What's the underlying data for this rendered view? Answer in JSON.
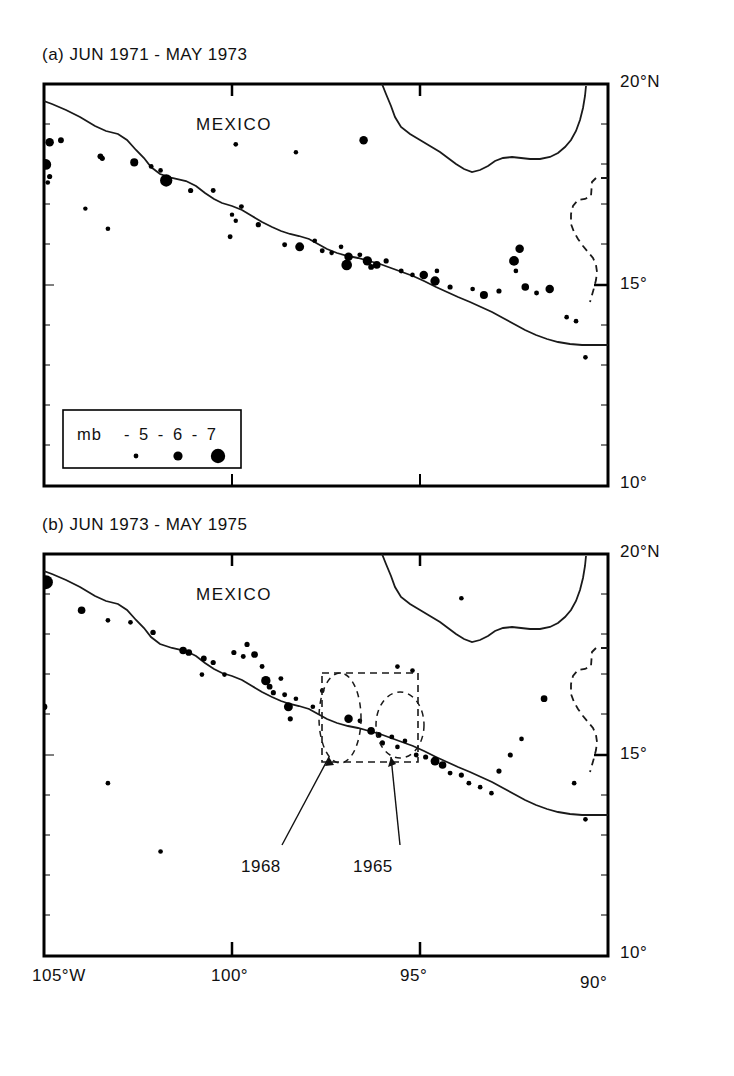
{
  "figure": {
    "panels": [
      {
        "id": "a",
        "title": "(a) JUN 1971 - MAY 1973",
        "region_label": "MEXICO"
      },
      {
        "id": "b",
        "title": "(b) JUN 1973 - MAY 1975",
        "region_label": "MEXICO"
      }
    ],
    "legend": {
      "title": "mb",
      "entries": "- 5 - 6 - 7",
      "magnitudes": [
        5,
        6,
        7
      ],
      "dot_radii_px": [
        2.2,
        4.4,
        6.6
      ]
    },
    "annotations": [
      {
        "label": "1968",
        "target": "ellipse-1968"
      },
      {
        "label": "1965",
        "target": "ellipse-1965"
      }
    ],
    "colors": {
      "ink": "#000000",
      "background": "#ffffff",
      "coastline": "#1a1a1a",
      "border_dashed": "#1a1a1a"
    }
  },
  "chart_data": {
    "type": "scatter",
    "xlabel": "Longitude",
    "ylabel": "Latitude",
    "xlim": [
      -105,
      -90
    ],
    "ylim": [
      10,
      20
    ],
    "grid": false,
    "legend_position": "inside-lower-left-panel-a",
    "xticks": [
      -105,
      -100,
      -95,
      -90
    ],
    "xticklabels": [
      "105°W",
      "100°",
      "95°",
      "90°"
    ],
    "yticks": [
      10,
      15,
      20
    ],
    "yticklabels": [
      "10°",
      "15°",
      "20°N"
    ],
    "size_encoding": {
      "variable": "mb",
      "levels": [
        5,
        6,
        7
      ],
      "label": "mb"
    },
    "panels": [
      {
        "id": "a",
        "label": "(a) JUN 1971 - MAY 1973",
        "points": [
          {
            "lon": -104.85,
            "lat": 18.55,
            "mb": 6.2
          },
          {
            "lon": -104.55,
            "lat": 18.6,
            "mb": 5.6
          },
          {
            "lon": -104.95,
            "lat": 18.0,
            "mb": 6.6
          },
          {
            "lon": -104.85,
            "lat": 17.7,
            "mb": 5.4
          },
          {
            "lon": -104.9,
            "lat": 17.55,
            "mb": 5.2
          },
          {
            "lon": -103.5,
            "lat": 18.2,
            "mb": 5.6
          },
          {
            "lon": -103.45,
            "lat": 18.15,
            "mb": 5.4
          },
          {
            "lon": -102.6,
            "lat": 18.05,
            "mb": 6.1
          },
          {
            "lon": -102.15,
            "lat": 17.95,
            "mb": 5.3
          },
          {
            "lon": -101.9,
            "lat": 17.85,
            "mb": 5.2
          },
          {
            "lon": -101.75,
            "lat": 17.6,
            "mb": 6.8
          },
          {
            "lon": -101.1,
            "lat": 17.35,
            "mb": 5.4
          },
          {
            "lon": -100.5,
            "lat": 17.35,
            "mb": 5.3
          },
          {
            "lon": -103.3,
            "lat": 16.4,
            "mb": 5.2
          },
          {
            "lon": -99.75,
            "lat": 16.95,
            "mb": 5.3
          },
          {
            "lon": -100.0,
            "lat": 16.75,
            "mb": 5.1
          },
          {
            "lon": -99.9,
            "lat": 16.6,
            "mb": 5.1
          },
          {
            "lon": -99.3,
            "lat": 16.5,
            "mb": 5.4
          },
          {
            "lon": -100.05,
            "lat": 16.2,
            "mb": 5.3
          },
          {
            "lon": -98.6,
            "lat": 16.0,
            "mb": 5.3
          },
          {
            "lon": -98.2,
            "lat": 15.95,
            "mb": 6.3
          },
          {
            "lon": -97.8,
            "lat": 16.1,
            "mb": 5.2
          },
          {
            "lon": -97.6,
            "lat": 15.85,
            "mb": 5.3
          },
          {
            "lon": -97.35,
            "lat": 15.8,
            "mb": 5.2
          },
          {
            "lon": -97.1,
            "lat": 15.95,
            "mb": 5.2
          },
          {
            "lon": -96.9,
            "lat": 15.7,
            "mb": 6.2
          },
          {
            "lon": -96.95,
            "lat": 15.5,
            "mb": 6.6
          },
          {
            "lon": -96.6,
            "lat": 15.75,
            "mb": 5.3
          },
          {
            "lon": -96.4,
            "lat": 15.6,
            "mb": 6.4
          },
          {
            "lon": -96.3,
            "lat": 15.45,
            "mb": 5.6
          },
          {
            "lon": -96.15,
            "lat": 15.5,
            "mb": 6.0
          },
          {
            "lon": -95.9,
            "lat": 15.6,
            "mb": 5.4
          },
          {
            "lon": -95.5,
            "lat": 15.35,
            "mb": 5.3
          },
          {
            "lon": -95.2,
            "lat": 15.25,
            "mb": 5.2
          },
          {
            "lon": -94.9,
            "lat": 15.25,
            "mb": 6.2
          },
          {
            "lon": -94.6,
            "lat": 15.1,
            "mb": 6.4
          },
          {
            "lon": -94.55,
            "lat": 15.35,
            "mb": 5.2
          },
          {
            "lon": -94.2,
            "lat": 14.95,
            "mb": 5.4
          },
          {
            "lon": -93.6,
            "lat": 14.9,
            "mb": 5.2
          },
          {
            "lon": -93.3,
            "lat": 14.75,
            "mb": 6.1
          },
          {
            "lon": -92.9,
            "lat": 14.85,
            "mb": 5.4
          },
          {
            "lon": -92.5,
            "lat": 15.6,
            "mb": 6.5
          },
          {
            "lon": -92.35,
            "lat": 15.9,
            "mb": 6.2
          },
          {
            "lon": -92.45,
            "lat": 15.35,
            "mb": 5.2
          },
          {
            "lon": -92.2,
            "lat": 14.95,
            "mb": 6.0
          },
          {
            "lon": -91.9,
            "lat": 14.8,
            "mb": 5.3
          },
          {
            "lon": -91.55,
            "lat": 14.9,
            "mb": 6.2
          },
          {
            "lon": -91.1,
            "lat": 14.2,
            "mb": 5.2
          },
          {
            "lon": -90.85,
            "lat": 14.1,
            "mb": 5.2
          },
          {
            "lon": -90.6,
            "lat": 13.2,
            "mb": 5.2
          },
          {
            "lon": -96.5,
            "lat": 18.6,
            "mb": 6.2
          },
          {
            "lon": -99.9,
            "lat": 18.5,
            "mb": 5.2
          },
          {
            "lon": -98.3,
            "lat": 18.3,
            "mb": 5.1
          },
          {
            "lon": -103.9,
            "lat": 16.9,
            "mb": 5.1
          }
        ]
      },
      {
        "id": "b",
        "label": "(b) JUN 1973 - MAY 1975",
        "points": [
          {
            "lon": -104.95,
            "lat": 19.3,
            "mb": 7.0
          },
          {
            "lon": -104.0,
            "lat": 18.6,
            "mb": 6.0
          },
          {
            "lon": -103.3,
            "lat": 18.35,
            "mb": 5.2
          },
          {
            "lon": -102.7,
            "lat": 18.3,
            "mb": 5.2
          },
          {
            "lon": -102.1,
            "lat": 18.05,
            "mb": 5.5
          },
          {
            "lon": -101.3,
            "lat": 17.6,
            "mb": 6.0
          },
          {
            "lon": -101.15,
            "lat": 17.55,
            "mb": 5.8
          },
          {
            "lon": -100.75,
            "lat": 17.4,
            "mb": 5.6
          },
          {
            "lon": -100.5,
            "lat": 17.3,
            "mb": 5.4
          },
          {
            "lon": -100.8,
            "lat": 17.0,
            "mb": 5.2
          },
          {
            "lon": -100.2,
            "lat": 17.0,
            "mb": 5.2
          },
          {
            "lon": -99.95,
            "lat": 17.55,
            "mb": 5.4
          },
          {
            "lon": -99.7,
            "lat": 17.45,
            "mb": 5.3
          },
          {
            "lon": -99.6,
            "lat": 17.75,
            "mb": 5.4
          },
          {
            "lon": -99.4,
            "lat": 17.5,
            "mb": 5.8
          },
          {
            "lon": -99.2,
            "lat": 17.2,
            "mb": 5.3
          },
          {
            "lon": -99.1,
            "lat": 16.85,
            "mb": 6.4
          },
          {
            "lon": -99.0,
            "lat": 16.7,
            "mb": 5.6
          },
          {
            "lon": -98.9,
            "lat": 16.55,
            "mb": 5.4
          },
          {
            "lon": -98.7,
            "lat": 16.9,
            "mb": 5.3
          },
          {
            "lon": -98.6,
            "lat": 16.5,
            "mb": 5.3
          },
          {
            "lon": -98.5,
            "lat": 16.2,
            "mb": 6.3
          },
          {
            "lon": -98.45,
            "lat": 15.9,
            "mb": 5.4
          },
          {
            "lon": -98.3,
            "lat": 16.4,
            "mb": 5.2
          },
          {
            "lon": -105.0,
            "lat": 16.2,
            "mb": 5.8
          },
          {
            "lon": -103.3,
            "lat": 14.3,
            "mb": 5.2
          },
          {
            "lon": -101.9,
            "lat": 12.6,
            "mb": 5.2
          },
          {
            "lon": -97.6,
            "lat": 16.6,
            "mb": 5.2
          },
          {
            "lon": -97.85,
            "lat": 16.2,
            "mb": 5.2
          },
          {
            "lon": -96.9,
            "lat": 15.9,
            "mb": 6.2
          },
          {
            "lon": -96.6,
            "lat": 15.85,
            "mb": 5.2
          },
          {
            "lon": -96.3,
            "lat": 15.6,
            "mb": 6.0
          },
          {
            "lon": -96.1,
            "lat": 15.5,
            "mb": 5.6
          },
          {
            "lon": -96.0,
            "lat": 15.3,
            "mb": 5.4
          },
          {
            "lon": -95.75,
            "lat": 15.45,
            "mb": 5.3
          },
          {
            "lon": -95.6,
            "lat": 15.2,
            "mb": 5.2
          },
          {
            "lon": -95.4,
            "lat": 15.35,
            "mb": 5.2
          },
          {
            "lon": -95.1,
            "lat": 15.0,
            "mb": 5.3
          },
          {
            "lon": -94.85,
            "lat": 14.95,
            "mb": 5.4
          },
          {
            "lon": -94.6,
            "lat": 14.85,
            "mb": 6.3
          },
          {
            "lon": -94.4,
            "lat": 14.75,
            "mb": 6.0
          },
          {
            "lon": -94.2,
            "lat": 14.55,
            "mb": 5.3
          },
          {
            "lon": -93.9,
            "lat": 14.5,
            "mb": 5.4
          },
          {
            "lon": -93.7,
            "lat": 14.3,
            "mb": 5.3
          },
          {
            "lon": -93.4,
            "lat": 14.2,
            "mb": 5.2
          },
          {
            "lon": -93.1,
            "lat": 14.05,
            "mb": 5.2
          },
          {
            "lon": -92.9,
            "lat": 14.6,
            "mb": 5.4
          },
          {
            "lon": -92.6,
            "lat": 15.0,
            "mb": 5.4
          },
          {
            "lon": -92.3,
            "lat": 15.4,
            "mb": 5.2
          },
          {
            "lon": -91.7,
            "lat": 16.4,
            "mb": 5.8
          },
          {
            "lon": -93.9,
            "lat": 18.9,
            "mb": 5.2
          },
          {
            "lon": -95.2,
            "lat": 17.1,
            "mb": 5.2
          },
          {
            "lon": -95.6,
            "lat": 17.2,
            "mb": 5.2
          },
          {
            "lon": -90.6,
            "lat": 13.4,
            "mb": 5.2
          },
          {
            "lon": -90.9,
            "lat": 14.3,
            "mb": 5.2
          }
        ]
      }
    ]
  }
}
